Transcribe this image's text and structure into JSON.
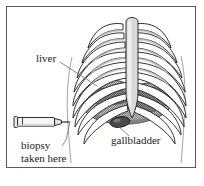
{
  "figure": {
    "background_color": "#ffffff",
    "frame_color": "#5a5a5a",
    "outline_color": "#1a1a1a",
    "labels": {
      "liver": "liver",
      "gallbladder": "gallbladder",
      "biopsy_line1": "biopsy",
      "biopsy_line2": "taken here"
    },
    "parts": {
      "ribcage": "ribcage",
      "sternum": "sternum",
      "liver_organ": "liver",
      "gallbladder_organ": "gallbladder",
      "syringe": "biopsy-needle-syringe",
      "body_outline": "body-outline"
    },
    "colors": {
      "bone_fill": "#ffffff",
      "bone_shadow": "#c9c9c9",
      "sternum_fill": "#d8d8d8",
      "liver_fill": "#9a9a9a",
      "liver_dark": "#6e6e6e",
      "gallbladder_fill": "#4a4a4a",
      "syringe_fill": "#f2f2f2",
      "line": "#1a1a1a",
      "leader": "#6b6b6b"
    },
    "rib_count_per_side": 9
  }
}
